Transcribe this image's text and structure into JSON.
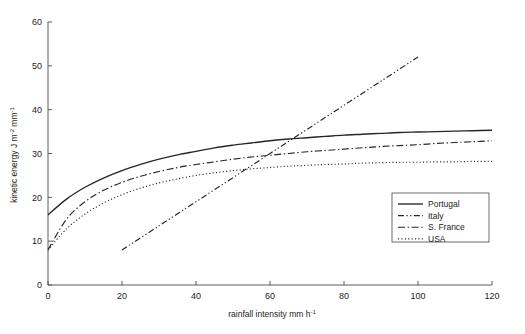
{
  "chart_data": {
    "type": "line",
    "title": "",
    "xlabel": "rainfall intensity  mm h",
    "xlabel_sup": "-1",
    "ylabel": "kinetic energy  J m",
    "ylabel_sup1": "-2",
    "ylabel_mid": " mm",
    "ylabel_sup2": "-1",
    "xlim": [
      0,
      120
    ],
    "ylim": [
      0,
      60
    ],
    "xticks": [
      0,
      20,
      40,
      60,
      80,
      100,
      120
    ],
    "yticks": [
      0,
      10,
      20,
      30,
      40,
      50,
      60
    ],
    "grid": false,
    "legend_position": "lower-right",
    "series": [
      {
        "name": "Portugal",
        "style": "solid",
        "x": [
          0,
          5,
          10,
          15,
          20,
          25,
          30,
          35,
          40,
          45,
          50,
          55,
          60,
          65,
          70,
          75,
          80,
          85,
          90,
          95,
          100,
          105,
          110,
          115,
          120
        ],
        "values": [
          16.0,
          19.6,
          22.3,
          24.4,
          26.1,
          27.5,
          28.7,
          29.7,
          30.5,
          31.3,
          31.9,
          32.4,
          32.9,
          33.3,
          33.6,
          33.9,
          34.2,
          34.4,
          34.6,
          34.8,
          34.9,
          35.0,
          35.1,
          35.2,
          35.3
        ]
      },
      {
        "name": "Italy",
        "style": "dashdotdot",
        "x": [
          20,
          30,
          40,
          50,
          60,
          70,
          80,
          90,
          100
        ],
        "values": [
          8.0,
          13.5,
          19.0,
          24.5,
          30.0,
          35.5,
          41.0,
          46.5,
          52.0
        ]
      },
      {
        "name": "S. France",
        "style": "dashdot",
        "x": [
          0,
          5,
          10,
          15,
          20,
          25,
          30,
          35,
          40,
          45,
          50,
          55,
          60,
          65,
          70,
          75,
          80,
          85,
          90,
          95,
          100,
          105,
          110,
          115,
          120
        ],
        "values": [
          8.0,
          15.0,
          19.0,
          21.6,
          23.4,
          24.8,
          25.9,
          26.8,
          27.5,
          28.1,
          28.7,
          29.2,
          29.6,
          30.0,
          30.4,
          30.7,
          31.0,
          31.3,
          31.6,
          31.8,
          32.0,
          32.3,
          32.5,
          32.7,
          32.9
        ]
      },
      {
        "name": "USA",
        "style": "dotted",
        "x": [
          0,
          5,
          10,
          15,
          20,
          25,
          30,
          35,
          40,
          45,
          50,
          55,
          60,
          65,
          70,
          75,
          80,
          85,
          90,
          95,
          100,
          105,
          110,
          115,
          120
        ],
        "values": [
          8.0,
          12.8,
          16.2,
          18.7,
          20.6,
          22.1,
          23.3,
          24.2,
          25.0,
          25.6,
          26.1,
          26.5,
          26.8,
          27.1,
          27.3,
          27.5,
          27.6,
          27.8,
          27.9,
          28.0,
          28.0,
          28.1,
          28.1,
          28.2,
          28.2
        ]
      }
    ],
    "legend_entries": [
      {
        "label": "Portugal",
        "style": "solid"
      },
      {
        "label": "Italy",
        "style": "dashdotdot"
      },
      {
        "label": "S. France",
        "style": "dashdot"
      },
      {
        "label": "USA",
        "style": "dotted"
      }
    ],
    "colors": {
      "line": "#262626",
      "axis": "#4a4a4a",
      "text": "#1d1d1d",
      "background": "#ffffff"
    }
  }
}
